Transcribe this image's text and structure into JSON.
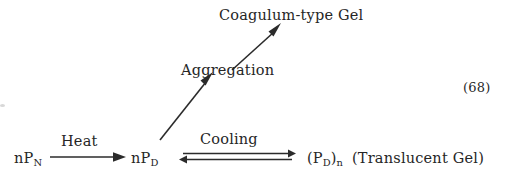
{
  "diagram": {
    "type": "reaction-scheme",
    "equation_number": "(68)",
    "nodes": {
      "reactant_native": "nP",
      "reactant_native_sub": "N",
      "intermediate_denatured": "nP",
      "intermediate_denatured_sub": "D",
      "product_coagulum": "Coagulum-type Gel",
      "product_translucent_open": "(P",
      "product_translucent_sub1": "D",
      "product_translucent_mid": ")",
      "product_translucent_sub2": "n",
      "product_translucent_note": "(Translucent Gel)"
    },
    "arrow_labels": {
      "heat": "Heat",
      "aggregation": "Aggregation",
      "cooling": "Cooling"
    },
    "arrows": [
      {
        "name": "heat-arrow",
        "kind": "single-right"
      },
      {
        "name": "aggregation-arrow-lower",
        "kind": "diagonal-up-right"
      },
      {
        "name": "aggregation-arrow-upper",
        "kind": "diagonal-up-right"
      },
      {
        "name": "cooling-equilibrium-arrow",
        "kind": "double-equilibrium"
      }
    ],
    "colors": {
      "ink": "#2b2b2b",
      "background": "#ffffff"
    }
  }
}
